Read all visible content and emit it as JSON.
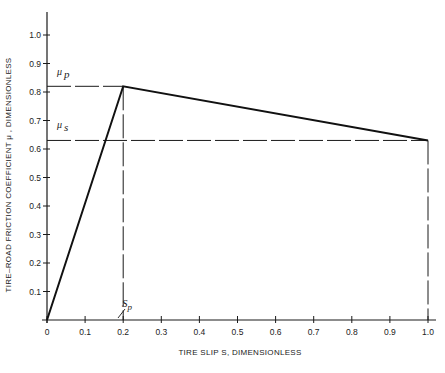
{
  "chart_data": {
    "type": "line",
    "title": "",
    "xlabel": "TIRE SLIP S, DIMENSIONLESS",
    "ylabel": "TIRE–ROAD FRICTION COEFFICIENT μ, DIMENSIONLESS",
    "xlim": [
      0,
      1.0
    ],
    "ylim": [
      0,
      1.0
    ],
    "grid": false,
    "legend": null,
    "x_ticks": [
      "0",
      "0.1",
      "0.2",
      "0.3",
      "0.4",
      "0.5",
      "0.6",
      "0.7",
      "0.8",
      "0.9",
      "1.0"
    ],
    "y_ticks": [
      "0.1",
      "0.2",
      "0.3",
      "0.4",
      "0.5",
      "0.6",
      "0.7",
      "0.8",
      "0.9",
      "1.0"
    ],
    "series": [
      {
        "name": "friction coefficient",
        "x": [
          0,
          0.2,
          1.0
        ],
        "y": [
          0,
          0.82,
          0.63
        ]
      }
    ],
    "annotations": [
      {
        "label": "μp",
        "value": 0.82,
        "type": "horizontal-dashed",
        "description": "peak friction coefficient"
      },
      {
        "label": "μs",
        "value": 0.63,
        "type": "horizontal-dashed",
        "description": "sliding friction coefficient"
      },
      {
        "label": "Sp",
        "value": 0.2,
        "type": "vertical-dashed",
        "description": "slip at peak"
      },
      {
        "label": "",
        "value": 1.0,
        "type": "vertical-dashed",
        "description": "full slip"
      }
    ]
  },
  "labels": {
    "x_axis_title": "TIRE SLIP  S, DIMENSIONLESS",
    "y_axis_title": "TIRE–ROAD FRICTION COEFFICIENT  μ , DIMENSIONLESS",
    "mu_p_main": "μ",
    "mu_p_sub": "p",
    "mu_s_main": "μ",
    "mu_s_sub": "s",
    "sp_main": "S",
    "sp_sub": "p"
  }
}
